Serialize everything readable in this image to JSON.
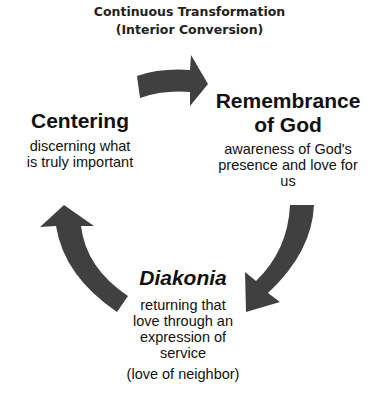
{
  "header": {
    "line1": "Continuous Transformation",
    "line2": "(Interior Conversion)"
  },
  "nodes": {
    "centering": {
      "title": "Centering",
      "desc_line1": "discerning what",
      "desc_line2": "is truly important"
    },
    "remembrance": {
      "title_line1": "Remembrance",
      "title_line2": "of God",
      "desc_line1": "awareness of God's",
      "desc_line2": "presence and love for",
      "desc_line3": "us"
    },
    "diakonia": {
      "title": "Diakonia",
      "desc_line1": "returning that",
      "desc_line2": "love through an",
      "desc_line3": "expression of",
      "desc_line4": "service",
      "note": "(love of neighbor)"
    }
  },
  "arrows": {
    "color": "#404040",
    "items": [
      {
        "from": "Centering",
        "to": "Remembrance of God"
      },
      {
        "from": "Remembrance of God",
        "to": "Diakonia"
      },
      {
        "from": "Diakonia",
        "to": "Centering"
      }
    ]
  }
}
